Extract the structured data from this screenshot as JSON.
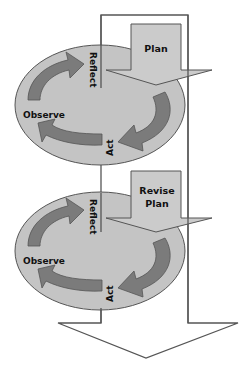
{
  "diagram": {
    "colors": {
      "ellipse_fill": "#c4c4c4",
      "cycle_arrow_fill": "#7b7b7b",
      "plan_arrow_fill": "#cbcbcb",
      "outline": "#555555",
      "background": "#ffffff"
    },
    "cycles": [
      {
        "plan_label_line1": "Plan",
        "plan_label_line2": "",
        "stages": {
          "reflect": "Reflect",
          "observe": "Observe",
          "act": "Act"
        }
      },
      {
        "plan_label_line1": "Revise",
        "plan_label_line2": "Plan",
        "stages": {
          "reflect": "Reflect",
          "observe": "Observe",
          "act": "Act"
        }
      }
    ],
    "flow_direction": "downward"
  }
}
